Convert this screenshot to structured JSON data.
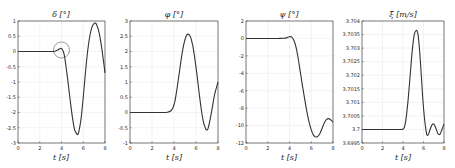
{
  "chart_data": [
    {
      "type": "line",
      "title": "δ [°]",
      "xlabel": "t [s]",
      "ylabel": "",
      "xlim": [
        0,
        8
      ],
      "ylim": [
        -3,
        1
      ],
      "xticks": [
        0,
        2,
        4,
        6,
        8
      ],
      "yticks": [
        1,
        0.5,
        0,
        -0.5,
        -1,
        -1.5,
        -2,
        -2.5,
        -3
      ],
      "ytick_labels": [
        "1",
        "0.5",
        "0",
        "-0.5",
        "-1",
        "-1.5",
        "-2",
        "-2.5",
        "-3"
      ],
      "grid": true,
      "annotation": "circle highlighting small bump near t≈4",
      "annotation_circle": {
        "x": 4.0,
        "y": 0.05,
        "r_px": 8
      },
      "series": [
        {
          "name": "δ",
          "x": [
            0,
            1,
            2,
            3,
            3.4,
            3.7,
            3.9,
            4.0,
            4.1,
            4.25,
            4.4,
            4.6,
            4.8,
            5.0,
            5.2,
            5.4,
            5.5,
            5.6,
            5.8,
            6.0,
            6.2,
            6.4,
            6.6,
            6.8,
            7.0,
            7.1,
            7.2,
            7.4,
            7.6,
            7.8,
            8.0
          ],
          "values": [
            0,
            0,
            0,
            0,
            0.01,
            0.06,
            0.1,
            0.1,
            0.05,
            -0.1,
            -0.45,
            -1.0,
            -1.6,
            -2.15,
            -2.55,
            -2.7,
            -2.72,
            -2.62,
            -2.2,
            -1.5,
            -0.7,
            0.0,
            0.5,
            0.8,
            0.92,
            0.93,
            0.9,
            0.7,
            0.35,
            -0.15,
            -0.7
          ]
        }
      ]
    },
    {
      "type": "line",
      "title": "φ [°]",
      "xlabel": "t [s]",
      "ylabel": "",
      "xlim": [
        0,
        8
      ],
      "ylim": [
        -1,
        3
      ],
      "xticks": [
        0,
        2,
        4,
        6,
        8
      ],
      "yticks": [
        3,
        2.5,
        2,
        1.5,
        1,
        0.5,
        0,
        -0.5,
        -1
      ],
      "ytick_labels": [
        "3",
        "2.5",
        "2",
        "1.5",
        "1",
        "0.5",
        "0",
        "-0.5",
        "-1"
      ],
      "grid": true,
      "series": [
        {
          "name": "φ",
          "x": [
            0,
            1,
            2,
            3,
            3.4,
            3.7,
            3.9,
            4.1,
            4.3,
            4.5,
            4.7,
            4.9,
            5.1,
            5.3,
            5.5,
            5.7,
            5.9,
            6.1,
            6.3,
            6.5,
            6.7,
            6.9,
            7.0,
            7.1,
            7.3,
            7.5,
            7.7,
            8.0
          ],
          "values": [
            0,
            0,
            0,
            0,
            0.01,
            0.05,
            0.15,
            0.4,
            0.85,
            1.35,
            1.85,
            2.25,
            2.5,
            2.57,
            2.48,
            2.2,
            1.75,
            1.2,
            0.6,
            0.05,
            -0.35,
            -0.55,
            -0.57,
            -0.52,
            -0.2,
            0.2,
            0.6,
            1.0
          ]
        }
      ]
    },
    {
      "type": "line",
      "title": "ψ [°]",
      "xlabel": "t [s]",
      "ylabel": "",
      "xlim": [
        0,
        8
      ],
      "ylim": [
        -12,
        2
      ],
      "xticks": [
        0,
        2,
        4,
        6,
        8
      ],
      "yticks": [
        2,
        0,
        -2,
        -4,
        -6,
        -8,
        -10,
        -12
      ],
      "ytick_labels": [
        "2",
        "0",
        "-2",
        "-4",
        "-6",
        "-8",
        "-10",
        "-12"
      ],
      "grid": true,
      "series": [
        {
          "name": "ψ",
          "x": [
            0,
            1,
            2,
            3,
            3.5,
            3.8,
            4.0,
            4.2,
            4.4,
            4.6,
            4.8,
            5.0,
            5.2,
            5.4,
            5.6,
            5.8,
            6.0,
            6.2,
            6.4,
            6.5,
            6.6,
            6.8,
            7.0,
            7.2,
            7.4,
            7.6,
            7.8,
            8.0
          ],
          "values": [
            0,
            0,
            0,
            0,
            0.02,
            0.1,
            0.2,
            0.15,
            -0.2,
            -1.0,
            -2.3,
            -3.9,
            -5.5,
            -7.0,
            -8.4,
            -9.6,
            -10.5,
            -11.1,
            -11.3,
            -11.32,
            -11.25,
            -10.9,
            -10.3,
            -9.7,
            -9.3,
            -9.2,
            -9.35,
            -9.6
          ]
        }
      ]
    },
    {
      "type": "line",
      "title": "ξ̇ [m/s]",
      "xlabel": "t [s]",
      "ylabel": "",
      "xlim": [
        0,
        8
      ],
      "ylim": [
        3.6995,
        3.704
      ],
      "xticks": [
        0,
        2,
        4,
        6,
        8
      ],
      "yticks": [
        3.704,
        3.7035,
        3.703,
        3.7025,
        3.702,
        3.7015,
        3.701,
        3.7005,
        3.7,
        3.6995
      ],
      "ytick_labels": [
        "3.704",
        "3.7035",
        "3.703",
        "3.7025",
        "3.702",
        "3.7015",
        "3.701",
        "3.7005",
        "3.7",
        "3.6995"
      ],
      "grid": true,
      "series": [
        {
          "name": "ξ̇",
          "x": [
            0,
            1,
            2,
            3,
            3.8,
            4.1,
            4.3,
            4.5,
            4.7,
            4.9,
            5.1,
            5.3,
            5.4,
            5.5,
            5.7,
            5.9,
            6.1,
            6.3,
            6.45,
            6.6,
            6.8,
            7.0,
            7.2,
            7.4,
            7.6,
            7.8,
            8.0
          ],
          "values": [
            3.7,
            3.7,
            3.7,
            3.7,
            3.7,
            3.70005,
            3.7004,
            3.7011,
            3.702,
            3.7029,
            3.7035,
            3.70365,
            3.7036,
            3.7034,
            3.7025,
            3.7013,
            3.7004,
            3.69985,
            3.6998,
            3.69995,
            3.70015,
            3.7002,
            3.70005,
            3.69985,
            3.69982,
            3.7,
            3.7002
          ]
        }
      ]
    }
  ],
  "panels": [
    {
      "title": "δ [°]",
      "xlabel": "t [s]"
    },
    {
      "title": "φ [°]",
      "xlabel": "t [s]"
    },
    {
      "title": "ψ [°]",
      "xlabel": "t [s]"
    },
    {
      "title": "ξ̇ [m/s]",
      "xlabel": "t [s]"
    }
  ],
  "colors": {
    "line": "#333333",
    "axes": "#262626",
    "grid": "#e6e6e6",
    "annotation": "#555555"
  }
}
